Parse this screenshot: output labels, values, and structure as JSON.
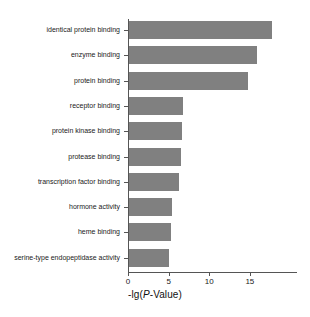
{
  "chart_data": {
    "type": "bar",
    "orientation": "horizontal",
    "title": "",
    "xlabel": "-lg(P-Value)",
    "ylabel": "",
    "categories": [
      "identical protein binding",
      "enzyme binding",
      "protein binding",
      "receptor binding",
      "protein kinase binding",
      "protease binding",
      "transcription factor binding",
      "hormone activity",
      "heme binding",
      "serine-type endopeptidase activity"
    ],
    "values": [
      17.6,
      15.8,
      14.6,
      6.7,
      6.5,
      6.4,
      6.2,
      5.3,
      5.2,
      4.9
    ],
    "xlim": [
      0,
      20.8
    ],
    "xticks": [
      0,
      5,
      10,
      15
    ],
    "xtick_labels": [
      "0",
      "5",
      "10",
      "15"
    ],
    "grid": false,
    "legend": null,
    "bar_color": "#808080",
    "axis_color": "#555555",
    "background": "#ffffff",
    "axis_title_parts": {
      "prefix": "-lg(",
      "italic": "P",
      "suffix": "-Value)"
    }
  }
}
